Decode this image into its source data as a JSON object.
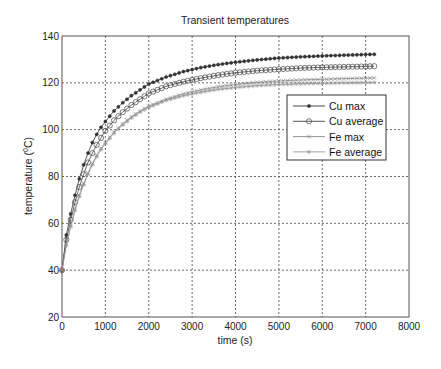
{
  "chart_data": {
    "type": "line",
    "title": "Transient temperatures",
    "xlabel": "time (s)",
    "ylabel": "temperature (0C)",
    "ylabel_parts": {
      "main": "temperature (",
      "sup": "0",
      "unit": "C)"
    },
    "xlim": [
      0,
      8000
    ],
    "ylim": [
      20,
      140
    ],
    "xticks": [
      0,
      1000,
      2000,
      3000,
      4000,
      5000,
      6000,
      7000,
      8000
    ],
    "yticks": [
      20,
      40,
      60,
      80,
      100,
      120,
      140
    ],
    "grid": true,
    "legend_position": "upper right (inside)",
    "x": [
      0,
      100,
      200,
      300,
      400,
      500,
      600,
      700,
      800,
      900,
      1000,
      1200,
      1400,
      1600,
      1800,
      2000,
      2400,
      2800,
      3200,
      3600,
      4000,
      4500,
      5000,
      5500,
      6000,
      6500,
      7000,
      7200
    ],
    "series": [
      {
        "name": "Cu max",
        "marker": "dot",
        "color": "#333333",
        "values": [
          40,
          55,
          64,
          72,
          79,
          85,
          90,
          94.5,
          98,
          101,
          103.5,
          108,
          111.5,
          114.5,
          117,
          119.5,
          122.5,
          124.8,
          126.5,
          127.8,
          128.8,
          129.8,
          130.6,
          131.1,
          131.5,
          131.8,
          132.1,
          132.2
        ]
      },
      {
        "name": "Cu average",
        "marker": "circle",
        "color": "#444444",
        "values": [
          40,
          53,
          61.5,
          69,
          75.5,
          81,
          86,
          90,
          93.5,
          96.5,
          99.5,
          104,
          107.5,
          110.5,
          113,
          115.5,
          118.5,
          120.5,
          122,
          123.3,
          124.3,
          125.2,
          125.8,
          126.3,
          126.6,
          126.8,
          127,
          127.1
        ]
      },
      {
        "name": "Fe max",
        "marker": "x",
        "color": "#888888",
        "values": [
          40,
          51,
          59,
          66,
          72,
          77,
          81.5,
          85.5,
          89,
          92,
          94.5,
          99,
          102.5,
          105.5,
          108,
          110,
          113,
          115.3,
          117,
          118.3,
          119.3,
          120.2,
          120.8,
          121.2,
          121.5,
          121.8,
          122,
          122.1
        ]
      },
      {
        "name": "Fe average",
        "marker": "star",
        "color": "#999999",
        "values": [
          40,
          50.5,
          58.5,
          65.5,
          71.5,
          76.5,
          81,
          85,
          88.5,
          91.5,
          94,
          98.5,
          102,
          105,
          107.5,
          109.5,
          112.5,
          114.5,
          116,
          117.2,
          118,
          118.8,
          119.3,
          119.6,
          119.8,
          120,
          120.1,
          120.2
        ]
      }
    ]
  }
}
